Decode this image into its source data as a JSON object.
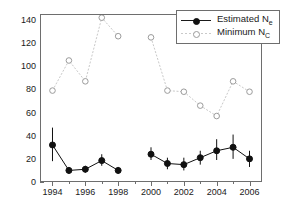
{
  "chart_data": {
    "type": "line",
    "title": "",
    "xlabel": "",
    "ylabel": "",
    "xlim": [
      1993.3,
      2006.7
    ],
    "ylim": [
      0,
      145
    ],
    "y_ticks": [
      0,
      20,
      40,
      60,
      80,
      100,
      120,
      140
    ],
    "x_ticks_major": [
      1994,
      1996,
      1998,
      2000,
      2002,
      2004,
      2006
    ],
    "x_ticks_minor": [
      1995,
      1997,
      1999,
      2001,
      2003,
      2005
    ],
    "grid": false,
    "legend_position": "top-right",
    "series": [
      {
        "name": "Estimated Ne",
        "label_text": "Estimated N",
        "label_sub": "e",
        "marker": "filled-circle",
        "color": "#111111",
        "line_style": "solid",
        "has_error_bars": true,
        "x": [
          1994,
          1995,
          1996,
          1997,
          1998,
          2000,
          2001,
          2002,
          2003,
          2004,
          2005,
          2006
        ],
        "values": [
          32,
          10,
          11,
          18.5,
          10,
          24,
          16,
          15,
          21,
          27,
          30,
          20
        ],
        "err_low": [
          18,
          7,
          8,
          14,
          7,
          19,
          11,
          10,
          15,
          19,
          20,
          13
        ],
        "err_high": [
          47,
          13,
          14,
          24,
          13,
          30,
          21,
          21,
          27,
          37,
          41,
          27
        ]
      },
      {
        "name": "Minimum Nc",
        "label_text": "Minimum N",
        "label_sub": "C",
        "marker": "open-circle",
        "color": "#c9c9c9",
        "line_style": "dotted",
        "has_error_bars": false,
        "x": [
          1994,
          1995,
          1996,
          1997,
          1998,
          2000,
          2001,
          2002,
          2003,
          2004,
          2005,
          2006
        ],
        "values": [
          79,
          105,
          87,
          142,
          126,
          125,
          79,
          78,
          66,
          57,
          87,
          78
        ]
      }
    ],
    "series_gap_after": 1998
  },
  "legend": {
    "entries": [
      {
        "text": "Estimated N",
        "sub": "e"
      },
      {
        "text": "Minimum N",
        "sub": "C"
      }
    ]
  },
  "axis": {
    "y_tick_labels": [
      "0",
      "20",
      "40",
      "60",
      "80",
      "100",
      "120",
      "140"
    ],
    "x_tick_labels": [
      "1994",
      "1996",
      "1998",
      "2000",
      "2002",
      "2004",
      "2006"
    ]
  },
  "colors": {
    "estimated": "#111111",
    "minimum": "#c9c9c9",
    "frame": "#6e6e6e",
    "text": "#1a1a1a",
    "background": "#ffffff"
  }
}
